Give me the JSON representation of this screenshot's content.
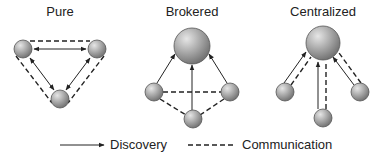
{
  "diagram": {
    "panels": [
      {
        "title": "Pure"
      },
      {
        "title": "Brokered"
      },
      {
        "title": "Centralized"
      }
    ],
    "legend": {
      "discovery": {
        "label": "Discovery",
        "style": "solid-arrow"
      },
      "communication": {
        "label": "Communication",
        "style": "dashed-line"
      }
    },
    "colors": {
      "line": "#222222",
      "node_light": "#d8d8d8",
      "node_dark": "#7a7a7a"
    }
  }
}
